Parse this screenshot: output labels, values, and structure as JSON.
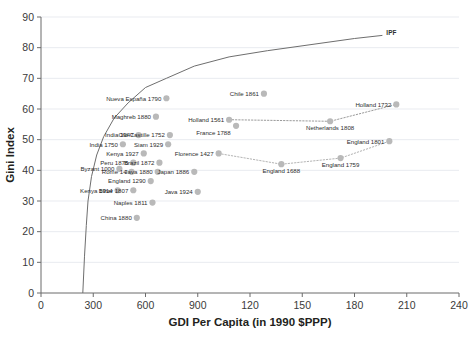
{
  "chart_data": {
    "type": "scatter",
    "title": "",
    "xlabel": "GDI Per Capita (in 1990 $PPP)",
    "ylabel": "Gini Index",
    "xlim": [
      0,
      240
    ],
    "ylim": [
      0,
      90
    ],
    "grid": true,
    "legend": "none",
    "xticks": [
      "0",
      "300",
      "600",
      "900",
      "120",
      "150",
      "180",
      "210",
      "240"
    ],
    "yticks": [
      "0",
      "10",
      "20",
      "30",
      "40",
      "50",
      "60",
      "70",
      "80",
      "90"
    ],
    "annotations": [
      {
        "text": "IPF",
        "x": 196,
        "y": 85,
        "note": "Inequality Possibility Frontier curve label"
      }
    ],
    "curves": [
      {
        "name": "IPF",
        "style": "solid",
        "color": "#6e6e6e",
        "points": [
          [
            24,
            0
          ],
          [
            25,
            12
          ],
          [
            26,
            22
          ],
          [
            27,
            30
          ],
          [
            29,
            38
          ],
          [
            32,
            45
          ],
          [
            36,
            51
          ],
          [
            42,
            57
          ],
          [
            50,
            62
          ],
          [
            60,
            67
          ],
          [
            72,
            70
          ],
          [
            88,
            74
          ],
          [
            108,
            77
          ],
          [
            130,
            79
          ],
          [
            155,
            81
          ],
          [
            180,
            83
          ],
          [
            196,
            84
          ]
        ]
      }
    ],
    "connectors": [
      {
        "name": "netherlands-series",
        "style": "dotted",
        "color": "#9a9a9a",
        "points": [
          "Holland 1561",
          "Netherlands 1808",
          "Holland 1732"
        ]
      },
      {
        "name": "england-series",
        "style": "dotted",
        "color": "#b4b4b4",
        "points": [
          "Florence 1427",
          "England 1688",
          "England 1759",
          "England 1801"
        ]
      }
    ],
    "marker_color": "#b9b9b9",
    "points": [
      {
        "label": "Nueva España 1790",
        "x": 72,
        "y": 63.5,
        "side": "left"
      },
      {
        "label": "Maghreb 1880",
        "x": 66,
        "y": 57.5,
        "side": "left"
      },
      {
        "label": "Holland 1561",
        "x": 108,
        "y": 56.5,
        "side": "left"
      },
      {
        "label": "Chile 1861",
        "x": 128,
        "y": 65.0,
        "side": "left"
      },
      {
        "label": "Holland 1732",
        "x": 204,
        "y": 61.5,
        "side": "left"
      },
      {
        "label": "India 1947",
        "x": 56,
        "y": 51.5,
        "side": "left"
      },
      {
        "label": "Old Castille 1752",
        "x": 74,
        "y": 51.5,
        "side": "left"
      },
      {
        "label": "France 1788",
        "x": 112,
        "y": 54.5,
        "side": "leftup"
      },
      {
        "label": "Netherlands 1808",
        "x": 166,
        "y": 56.0,
        "side": "down"
      },
      {
        "label": "England 1801",
        "x": 200,
        "y": 49.5,
        "side": "left"
      },
      {
        "label": "India 1750",
        "x": 47,
        "y": 48.5,
        "side": "left"
      },
      {
        "label": "Siam 1929",
        "x": 73,
        "y": 48.5,
        "side": "left"
      },
      {
        "label": "Kenya 1927",
        "x": 59,
        "y": 45.5,
        "side": "left"
      },
      {
        "label": "Florence 1427",
        "x": 102,
        "y": 45.5,
        "side": "left"
      },
      {
        "label": "Peru 1876",
        "x": 53,
        "y": 42.5,
        "side": "left"
      },
      {
        "label": "Brazil 1872",
        "x": 68,
        "y": 42.5,
        "side": "left"
      },
      {
        "label": "England 1688",
        "x": 138,
        "y": 42.0,
        "side": "down"
      },
      {
        "label": "England 1759",
        "x": 172,
        "y": 44.0,
        "side": "down"
      },
      {
        "label": "Byzant 1000",
        "x": 45,
        "y": 40.5,
        "side": "left"
      },
      {
        "label": "Rome 14",
        "x": 52,
        "y": 39.5,
        "side": "left"
      },
      {
        "label": "Java 1880",
        "x": 67,
        "y": 39.5,
        "side": "left"
      },
      {
        "label": "Japan 1886",
        "x": 88,
        "y": 39.5,
        "side": "left"
      },
      {
        "label": "England 1290",
        "x": 63,
        "y": 36.5,
        "side": "left"
      },
      {
        "label": "Kenya 1914",
        "x": 44,
        "y": 33.5,
        "side": "left"
      },
      {
        "label": "Bihar 1807",
        "x": 53,
        "y": 33.5,
        "side": "left"
      },
      {
        "label": "Java 1924",
        "x": 90,
        "y": 33.0,
        "side": "left"
      },
      {
        "label": "Naples 1811",
        "x": 64,
        "y": 29.5,
        "side": "left"
      },
      {
        "label": "China 1880",
        "x": 55,
        "y": 24.5,
        "side": "left"
      }
    ]
  }
}
